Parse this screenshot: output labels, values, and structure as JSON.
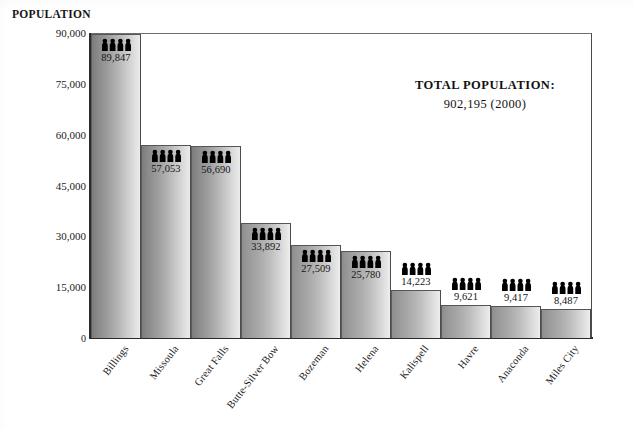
{
  "chart_data": {
    "type": "bar",
    "title": "POPULATION",
    "xlabel": "",
    "ylabel": "POPULATION",
    "ylim": [
      0,
      90000
    ],
    "grid": false,
    "legend": "none",
    "categories": [
      "Billings",
      "Missoula",
      "Great Falls",
      "Butte-Silver Bow",
      "Bozeman",
      "Helena",
      "Kalispell",
      "Havre",
      "Anaconda",
      "Miles City"
    ],
    "values": [
      89847,
      57053,
      56690,
      33892,
      27509,
      25780,
      14223,
      9621,
      9417,
      8487
    ],
    "value_labels": [
      "89,847",
      "57,053",
      "56,690",
      "33,892",
      "27,509",
      "25,780",
      "14,223",
      "9,621",
      "9,417",
      "8,487"
    ],
    "yticks": [
      0,
      15000,
      30000,
      45000,
      60000,
      75000,
      90000
    ],
    "ytick_labels": [
      "0",
      "15,000",
      "30,000",
      "45,000",
      "60,000",
      "75,000",
      "90,000"
    ],
    "annotations": [
      {
        "line1": "TOTAL POPULATION:",
        "line2": "902,195  (2000)"
      }
    ],
    "bar_marker_icon": "people-group-icon",
    "bar_marker_icon_count": 4
  },
  "colors": {
    "bar_light": "#ededed",
    "bar_dark": "#8e8e8e",
    "axis": "#2b2b2b",
    "text": "#1a1a1a",
    "background": "#ffffff",
    "icon": "#000000"
  }
}
